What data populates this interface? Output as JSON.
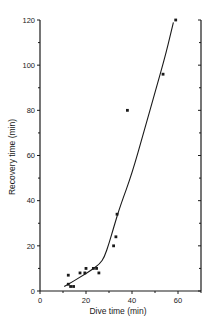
{
  "chart_data": {
    "type": "scatter",
    "title": "",
    "xlabel": "Dive time  (min)",
    "ylabel": "Recovery time  (min)",
    "xlim": [
      0,
      70
    ],
    "ylim": [
      0,
      120
    ],
    "x_ticks_major": [
      0,
      20,
      40,
      60
    ],
    "x_ticks_minor": [
      10,
      30,
      50,
      70
    ],
    "y_ticks_major": [
      0,
      20,
      40,
      60,
      80,
      100,
      120
    ],
    "y_ticks_minor": [
      10,
      30,
      50,
      70,
      90,
      110
    ],
    "grid": false,
    "legend": null,
    "right_axis": true,
    "series": [
      {
        "name": "observations",
        "kind": "points",
        "points": [
          {
            "x": 12.3,
            "y": 7
          },
          {
            "x": 12.3,
            "y": 3
          },
          {
            "x": 13.3,
            "y": 2
          },
          {
            "x": 14.6,
            "y": 2
          },
          {
            "x": 17.4,
            "y": 8
          },
          {
            "x": 19.5,
            "y": 8
          },
          {
            "x": 20,
            "y": 10
          },
          {
            "x": 23.2,
            "y": 10
          },
          {
            "x": 24.6,
            "y": 10
          },
          {
            "x": 25.6,
            "y": 8
          },
          {
            "x": 32,
            "y": 20
          },
          {
            "x": 33,
            "y": 24
          },
          {
            "x": 33.5,
            "y": 34
          },
          {
            "x": 38,
            "y": 80
          },
          {
            "x": 53.5,
            "y": 96
          },
          {
            "x": 59,
            "y": 120
          }
        ]
      },
      {
        "name": "fitted curve",
        "kind": "line",
        "points": [
          {
            "x": 10.5,
            "y": 2
          },
          {
            "x": 14,
            "y": 4
          },
          {
            "x": 18,
            "y": 6.5
          },
          {
            "x": 22,
            "y": 9
          },
          {
            "x": 26,
            "y": 12
          },
          {
            "x": 28,
            "y": 15
          },
          {
            "x": 30,
            "y": 21
          },
          {
            "x": 32,
            "y": 28
          },
          {
            "x": 35,
            "y": 38
          },
          {
            "x": 40,
            "y": 52
          },
          {
            "x": 45,
            "y": 70
          },
          {
            "x": 50,
            "y": 88
          },
          {
            "x": 55,
            "y": 106
          },
          {
            "x": 58,
            "y": 119
          }
        ]
      }
    ]
  },
  "colors": {
    "ink": "#1a1a1a",
    "background": "#ffffff"
  }
}
